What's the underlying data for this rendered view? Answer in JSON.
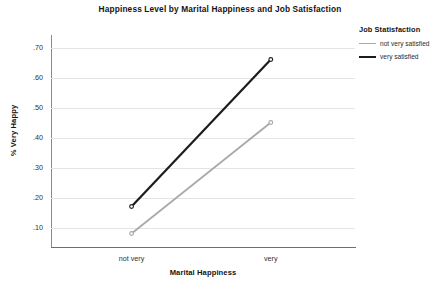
{
  "chart_data": {
    "type": "line",
    "title": "Happiness Level by Marital Happiness and Job Satisfaction",
    "xlabel": "Marital Happiness",
    "ylabel": "% Very Happy",
    "categories": [
      "not very",
      "very"
    ],
    "ylim": [
      0.035,
      0.735
    ],
    "yticks": [
      0.1,
      0.2,
      0.3,
      0.4,
      0.5,
      0.6,
      0.7
    ],
    "ytick_labels": [
      ".10",
      ".20",
      ".30",
      ".40",
      ".50",
      ".60",
      ".70"
    ],
    "grid": true,
    "legend_position": "right",
    "legend_title": "Job Statisfaction",
    "series": [
      {
        "name": "not very satisfied",
        "color": "#a8a8a8",
        "values": [
          0.08,
          0.45
        ],
        "markers": true
      },
      {
        "name": "very satisfied",
        "color": "#1c1c1c",
        "values": [
          0.17,
          0.66
        ],
        "markers": true
      }
    ]
  },
  "axis": {
    "y_labels": [
      ".70",
      ".60",
      ".50",
      ".40",
      ".30",
      ".20",
      ".10"
    ],
    "x_labels": [
      "not very",
      "very"
    ]
  },
  "legend": {
    "title": "Job Statisfaction",
    "items": [
      {
        "label": "not very satisfied"
      },
      {
        "label": "very satisfied"
      }
    ]
  },
  "colors": {
    "series_light": "#a8a8a8",
    "series_dark": "#1c1c1c",
    "gridline": "#e4e4e4",
    "axis": "#8a8a8a",
    "text": "#141414",
    "background": "#ffffff"
  }
}
